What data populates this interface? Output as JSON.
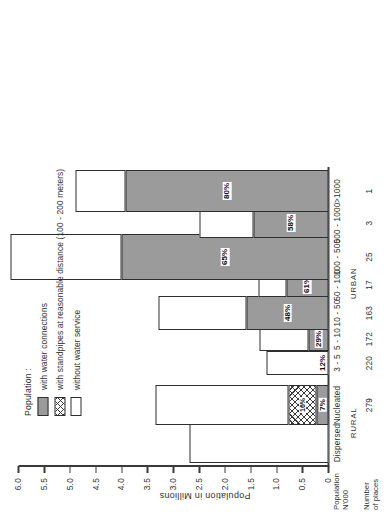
{
  "chart_data": {
    "type": "bar",
    "title": "",
    "subtitle": "",
    "orientation": "vertical-stacked",
    "ylabel": "Population in Millions",
    "xlabel": "",
    "ylim": [
      0,
      6.0
    ],
    "ytick_step": 0.5,
    "ytick_labels": [
      "6.0",
      "5.5",
      "5.0",
      "4.5",
      "4.0",
      "3.5",
      "3.0",
      "2.5",
      "2.0",
      "1.5",
      "1.0",
      "0.5",
      "0"
    ],
    "ytick_values": [
      6.0,
      5.5,
      5.0,
      4.5,
      4.0,
      3.5,
      3.0,
      2.5,
      2.0,
      1.5,
      1.0,
      0.5,
      0
    ],
    "grid": false,
    "legend_position": "upper-left",
    "legend_title": "Population :",
    "series": [
      {
        "name": "with water connections",
        "key": "connections",
        "values": [
          0.0,
          0.235,
          0.0,
          0.38,
          1.58,
          0.82,
          4.0,
          1.45,
          3.92
        ]
      },
      {
        "name": "with standpipes at reasonable distance (100 - 200 meters)",
        "key": "standpipes",
        "values": [
          0.0,
          0.54,
          0.0,
          0.0,
          0.0,
          0.0,
          0.0,
          0.0,
          0.0
        ]
      },
      {
        "name": "without water service",
        "key": "noservice",
        "values": [
          2.7,
          2.57,
          1.2,
          0.95,
          1.72,
          0.53,
          2.15,
          1.05,
          0.98
        ]
      }
    ],
    "categories": [
      "Dispersed",
      "Nucleated",
      "3 - 5",
      "5 - 10",
      "10 - 50",
      "50 - 100",
      "100 - 500",
      "500 - 1000",
      ">1000"
    ],
    "category_totals": [
      2.7,
      3.35,
      1.2,
      1.33,
      3.3,
      1.35,
      6.15,
      2.5,
      4.9
    ],
    "bar_labels": [
      "",
      "7%",
      "12%",
      "29%",
      "48%",
      "61%",
      "65%",
      "58%",
      "80%"
    ],
    "secondary_bar_labels": [
      "",
      "16%",
      "",
      "",
      "",
      "",
      "",
      "",
      ""
    ],
    "axis_group_labels": [
      {
        "label": "RURAL",
        "categories": [
          "Dispersed",
          "Nucleated"
        ]
      },
      {
        "label": "URBAN",
        "categories": [
          "3 - 5",
          "5 - 10",
          "10 - 50",
          "50 - 100",
          "100 - 500",
          "500 - 1000",
          ">1000"
        ]
      }
    ],
    "row_headers": [
      {
        "line1": "Population",
        "line2": "N'000"
      },
      {
        "line1": "Number",
        "line2": "of places"
      }
    ],
    "number_of_places": [
      "",
      "279",
      "220",
      "172",
      "163",
      "17",
      "25",
      "3",
      "1"
    ]
  },
  "legend": {
    "title": "Population :",
    "items": [
      {
        "label": "with water connections",
        "swatch": "connections"
      },
      {
        "label": "with standpipes at reasonable distance (100 - 200 meters)",
        "swatch": "standpipes"
      },
      {
        "label": "without water service",
        "swatch": "noservice"
      }
    ]
  },
  "axes": {
    "y_title": "Population in Millions",
    "y_ticks": [
      "6.0",
      "5.5",
      "5.0",
      "4.5",
      "4.0",
      "3.5",
      "3.0",
      "2.5",
      "2.0",
      "1.5",
      "1.0",
      "0.5",
      "0"
    ]
  },
  "row_labels": {
    "population_line1": "Population",
    "population_line2": "N'000",
    "places_line1": "Number",
    "places_line2": "of places"
  },
  "groups": {
    "rural": "RURAL",
    "urban": "URBAN"
  },
  "colors": {
    "connections": "#9b9b9b",
    "standpipes": "#ffffff",
    "noservice": "#ffffff",
    "stroke": "#2e2e2e",
    "text": "#2f2f2f",
    "background": "#ffffff"
  }
}
